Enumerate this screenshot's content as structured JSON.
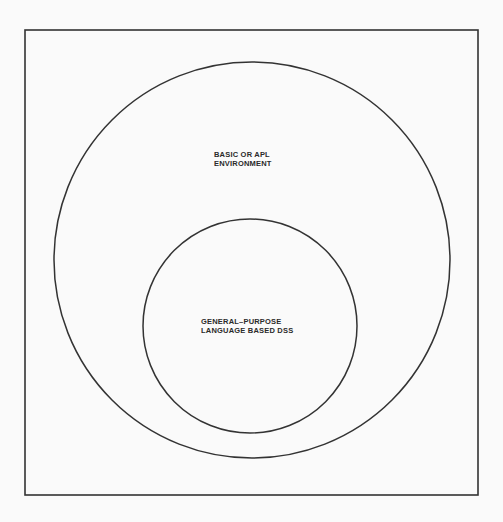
{
  "diagram": {
    "outer_circle": {
      "label_lines": [
        "BASIC OR APL",
        "ENVIRONMENT"
      ]
    },
    "inner_circle": {
      "label_lines": [
        "GENERAL–PURPOSE",
        "LANGUAGE BASED DSS"
      ]
    },
    "colors": {
      "background": "#fafafa",
      "stroke": "#333333",
      "text": "#2a2a2a"
    }
  }
}
